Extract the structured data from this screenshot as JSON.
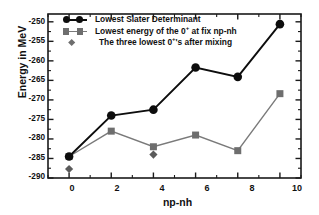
{
  "chart_data": {
    "type": "line",
    "title": "",
    "xlabel": "np-nh",
    "ylabel": "Energy in MeV",
    "xlim": [
      -1,
      11
    ],
    "ylim": [
      -290,
      -248
    ],
    "xticks": [
      0,
      2,
      4,
      6,
      8,
      10
    ],
    "xticklabels": [
      "0",
      "2",
      "4",
      "6",
      "8",
      "10"
    ],
    "yticks": [
      -250,
      -255,
      -260,
      -265,
      -270,
      -275,
      -280,
      -285,
      -290
    ],
    "yticklabels": [
      "-250",
      "-255",
      "-260",
      "-265",
      "-270",
      "-275",
      "-280",
      "-285",
      "-290"
    ],
    "grid": false,
    "legend_position": "upper left",
    "series": [
      {
        "name": "Lowest Slater Determinant",
        "marker": "circle",
        "color": "#0d0d0d",
        "line_color": "#0d0d0d",
        "x": [
          0,
          2,
          4,
          6,
          8,
          10
        ],
        "values": [
          -284.5,
          -274.0,
          -272.5,
          -261.7,
          -264.1,
          -250.6
        ]
      },
      {
        "name": "Lowest energy of the 0+ at fix np-nh",
        "marker": "square",
        "color": "#6e6e6e",
        "line_color": "#7a7a7a",
        "x": [
          0,
          2,
          4,
          6,
          8,
          10
        ],
        "values": [
          -284.5,
          -278.0,
          -282.0,
          -279.0,
          -283.0,
          -268.4
        ]
      },
      {
        "name": "The three lowest 0+'s after mixing",
        "marker": "diamond",
        "color": "#5a5a5a",
        "line_color": "none",
        "x": [
          0,
          4
        ],
        "values": [
          -287.7,
          -284.0
        ]
      }
    ]
  },
  "legend": {
    "items": [
      {
        "label_pre": "Lowest Slater Determinant",
        "sup": "",
        "label_post": "",
        "marker": "circle-pair"
      },
      {
        "label_pre": "Lowest energy of the 0",
        "sup": "+",
        "label_post": " at fix np-nh",
        "marker": "square-pair"
      },
      {
        "label_pre": "The three lowest 0",
        "sup": "+",
        "label_post": "'s after mixing",
        "marker": "diamond-single"
      }
    ]
  },
  "axes": {
    "y_title": "Energy in MeV",
    "x_title": "np-nh"
  }
}
